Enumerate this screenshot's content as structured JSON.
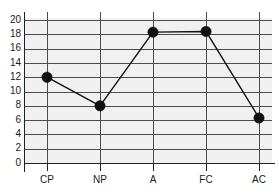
{
  "chart_data": {
    "type": "line",
    "title": "",
    "subtitle": "",
    "xlabel": "",
    "ylabel": "",
    "categories": [
      "CP",
      "NP",
      "A",
      "FC",
      "AC"
    ],
    "values": [
      12,
      8,
      18.3,
      18.4,
      6.3
    ],
    "series": [
      {
        "name": "",
        "values": [
          12,
          8,
          18.3,
          18.4,
          6.3
        ]
      }
    ],
    "ylim": [
      0,
      20
    ],
    "yticks": [
      0,
      2,
      4,
      6,
      8,
      10,
      12,
      14,
      16,
      18,
      20
    ],
    "ytick_labels": [
      "0",
      "2",
      "4",
      "6",
      "8",
      "10",
      "12",
      "14",
      "16",
      "18",
      "20"
    ],
    "xtick_labels": [
      "CP",
      "NP",
      "A",
      "FC",
      "AC"
    ],
    "grid": true,
    "grid_axis": "both",
    "legend": false,
    "legend_position": "none",
    "marker": "filled-circle",
    "marker_color": "#111111",
    "line_color": "#111111",
    "plot_background": "#f0f0f0",
    "page_background": "#ffffff",
    "grid_color": "#4d4d4d",
    "axis_color": "#222222",
    "text_color": "#1a1a1a"
  }
}
